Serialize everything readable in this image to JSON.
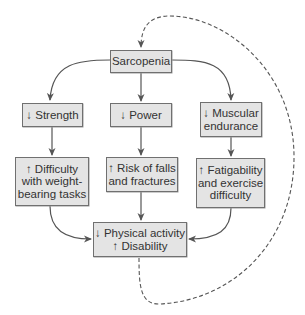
{
  "diagram": {
    "type": "flowchart",
    "colors": {
      "node_fill": "#e4e4e4",
      "node_border": "#707070",
      "arrow": "#555555",
      "text": "#333333",
      "feedback_dashed": "#555555"
    },
    "nodes": {
      "sarcopenia": {
        "lines": [
          "Sarcopenia"
        ]
      },
      "strength": {
        "lines": [
          "↓ Strength"
        ]
      },
      "power": {
        "lines": [
          "↓ Power"
        ]
      },
      "muscular_endurance": {
        "lines": [
          "↓ Muscular",
          "endurance"
        ]
      },
      "difficulty": {
        "lines": [
          "↑ Difficulty",
          "with weight-",
          "bearing tasks"
        ]
      },
      "risk": {
        "lines": [
          "↑ Risk of falls",
          "and fractures"
        ]
      },
      "fatigability": {
        "lines": [
          "↑ Fatigability",
          "and exercise",
          "difficulty"
        ]
      },
      "outcome": {
        "lines": [
          "↓ Physical activity",
          "↑ Disability"
        ]
      }
    },
    "edges": [
      {
        "from": "sarcopenia",
        "to": "strength",
        "style": "solid"
      },
      {
        "from": "sarcopenia",
        "to": "power",
        "style": "solid"
      },
      {
        "from": "sarcopenia",
        "to": "muscular_endurance",
        "style": "solid"
      },
      {
        "from": "strength",
        "to": "difficulty",
        "style": "solid"
      },
      {
        "from": "power",
        "to": "risk",
        "style": "solid"
      },
      {
        "from": "muscular_endurance",
        "to": "fatigability",
        "style": "solid"
      },
      {
        "from": "difficulty",
        "to": "outcome",
        "style": "solid"
      },
      {
        "from": "risk",
        "to": "outcome",
        "style": "solid"
      },
      {
        "from": "fatigability",
        "to": "outcome",
        "style": "solid"
      },
      {
        "from": "outcome",
        "to": "sarcopenia",
        "style": "dashed",
        "label": "feedback loop"
      }
    ]
  }
}
